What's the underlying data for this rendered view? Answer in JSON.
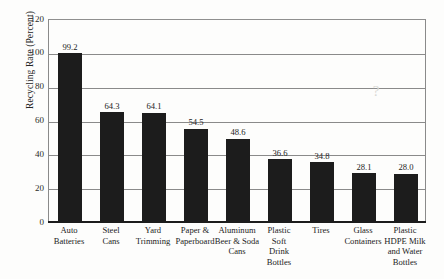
{
  "chart_data": {
    "type": "bar",
    "title": "",
    "subtitle": "",
    "xlabel": "",
    "ylabel": "Recycling Rate (Percent)",
    "ylim": [
      0,
      120
    ],
    "ytick_step": 20,
    "yticks": [
      "0",
      "20",
      "40",
      "60",
      "80",
      "100",
      "120"
    ],
    "grid": true,
    "legend": null,
    "bar_color": "#1c1c1c",
    "categories": [
      "Auto Batteries",
      "Steel Cans",
      "Yard Trimming",
      "Paper & Paperboard",
      "Aluminum Beer & Soda Cans",
      "Plastic Soft Drink Bottles",
      "Tires",
      "Glass Containers",
      "Plastic HDPE Milk and Water Bottles"
    ],
    "category_lines": [
      [
        "Auto",
        "Batteries"
      ],
      [
        "Steel",
        "Cans"
      ],
      [
        "Yard",
        "Trimming"
      ],
      [
        "Paper &",
        "Paperboard"
      ],
      [
        "Aluminum",
        "Beer & Soda",
        "Cans"
      ],
      [
        "Plastic",
        "Soft",
        "Drink",
        "Bottles"
      ],
      [
        "Tires"
      ],
      [
        "Glass",
        "Containers"
      ],
      [
        "Plastic",
        "HDPE Milk",
        "and Water",
        "Bottles"
      ]
    ],
    "values": [
      99.2,
      64.3,
      64.1,
      54.5,
      48.6,
      36.6,
      34.8,
      28.1,
      28.0
    ],
    "value_labels": [
      "99.2",
      "64.3",
      "64.1",
      "54.5",
      "48.6",
      "36.6",
      "34.8",
      "28.1",
      "28.0"
    ]
  },
  "artifact": {
    "glyph": "?"
  }
}
